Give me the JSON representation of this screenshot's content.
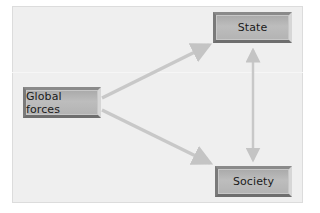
{
  "diagram": {
    "type": "flow",
    "nodes": [
      {
        "id": "global",
        "label": "Global forces"
      },
      {
        "id": "state",
        "label": "State"
      },
      {
        "id": "society",
        "label": "Society"
      }
    ],
    "edges": [
      {
        "from": "global",
        "to": "state",
        "direction": "one-way"
      },
      {
        "from": "global",
        "to": "society",
        "direction": "one-way"
      },
      {
        "from": "state",
        "to": "society",
        "direction": "two-way"
      }
    ]
  },
  "colors": {
    "background": "#efefef",
    "arrow": "#c8c8c8",
    "node_fill": "#b5b5b5",
    "node_text": "#1a1a1a"
  }
}
